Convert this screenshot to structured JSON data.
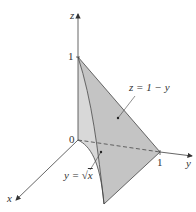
{
  "figure": {
    "type": "3d-region-diagram",
    "axes": {
      "x": {
        "label": "x"
      },
      "y": {
        "label": "y",
        "tick": "1"
      },
      "z": {
        "label": "z",
        "tick": "1"
      },
      "origin_label": "0"
    },
    "surfaces": [
      {
        "name": "plane",
        "equation": "z = 1 − y",
        "color": "#c4c4c4"
      },
      {
        "name": "cylinder",
        "equation": "y = √x",
        "color": "#d8d8d8"
      }
    ],
    "labels": {
      "plane_label": "z = 1 − y",
      "cylinder_label_prefix": "y = ",
      "cylinder_label_sqrt": "√",
      "cylinder_label_var": "x"
    },
    "colors": {
      "axis": "#555555",
      "edge": "#444444",
      "face_light": "#d8d8d8",
      "face_dark": "#c4c4c4",
      "text": "#333333"
    }
  }
}
